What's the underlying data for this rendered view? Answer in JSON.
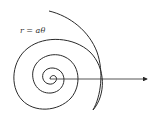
{
  "diagram": {
    "equation_label": "r = aθ",
    "stroke_color": "#2a2a2a",
    "background": "#ffffff",
    "center": [
      50,
      79
    ],
    "arrow": {
      "from": [
        50,
        79
      ],
      "to": [
        148,
        79
      ]
    }
  }
}
